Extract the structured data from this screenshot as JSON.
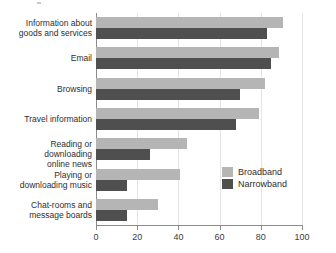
{
  "chart_data": {
    "type": "bar",
    "orientation": "horizontal",
    "title": "",
    "subtitle": "",
    "xlabel": "",
    "ylabel": "",
    "xlim": [
      0,
      100
    ],
    "xticks": [
      0,
      20,
      40,
      60,
      80,
      100
    ],
    "xtick_labels": [
      "0",
      "20",
      "40",
      "60",
      "80",
      "100"
    ],
    "grid": true,
    "grid_axis": "x",
    "legend_position": "center-right-inside",
    "categories": [
      "Information about goods and services",
      "Email",
      "Browsing",
      "Travel information",
      "Reading or downloading online news",
      "Playing or downloading music",
      "Chat-rooms and message boards"
    ],
    "category_label_lines": [
      [
        "Information about",
        "goods and services"
      ],
      [
        "Email"
      ],
      [
        "Browsing"
      ],
      [
        "Travel information"
      ],
      [
        "Reading or downloading",
        "online news"
      ],
      [
        "Playing or",
        "downloading music"
      ],
      [
        "Chat-rooms and",
        "message boards"
      ]
    ],
    "series": [
      {
        "name": "Broadband",
        "color": "#b5b5b5",
        "values": [
          91,
          89,
          82,
          79,
          44,
          41,
          30
        ]
      },
      {
        "name": "Narrowband",
        "color": "#4f4f4f",
        "values": [
          83,
          85,
          70,
          68,
          26,
          15,
          15
        ]
      }
    ]
  },
  "legend": {
    "entries": [
      {
        "label": "Broadband",
        "swatch": "broadband"
      },
      {
        "label": "Narrowband",
        "swatch": "narrowband"
      }
    ]
  },
  "colors": {
    "broadband": "#b5b5b5",
    "narrowband": "#4f4f4f",
    "axis": "#8c8c8c",
    "grid": "#e4e4e4",
    "text": "#2e2e2e",
    "background": "#ffffff"
  }
}
